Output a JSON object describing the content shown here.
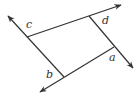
{
  "diagram": {
    "colors": {
      "line": "#333333",
      "background": "#ffffff"
    },
    "points": {
      "c_corner": [
        27,
        37
      ],
      "d_corner": [
        89,
        16
      ],
      "a_corner": [
        114,
        47
      ],
      "b_corner": [
        64,
        77
      ]
    },
    "lines": [
      {
        "name": "top-line",
        "from": [
          27,
          37
        ],
        "to": [
          121,
          5
        ],
        "arrow_end": "to"
      },
      {
        "name": "left-line",
        "from": [
          64,
          77
        ],
        "to": [
          8,
          16
        ],
        "arrow_end": "to"
      },
      {
        "name": "right-line",
        "from": [
          89,
          16
        ],
        "to": [
          133,
          68
        ],
        "arrow_end": "to"
      },
      {
        "name": "bottom-line",
        "from": [
          114,
          47
        ],
        "to": [
          40,
          92
        ],
        "arrow_end": "to"
      }
    ],
    "labels": {
      "a": "a",
      "b": "b",
      "c": "c",
      "d": "d"
    }
  }
}
